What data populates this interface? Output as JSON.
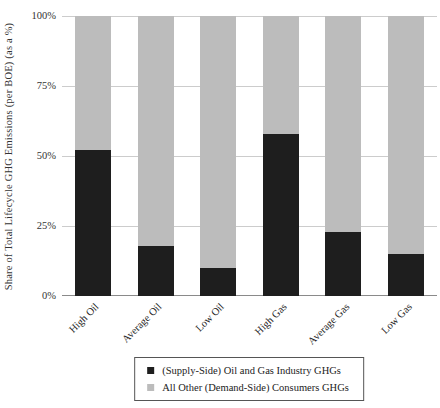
{
  "chart_data": {
    "type": "bar",
    "stacked": true,
    "categories": [
      "High Oil",
      "Average Oil",
      "Low Oil",
      "High Gas",
      "Average Gas",
      "Low Gas"
    ],
    "series": [
      {
        "name": "(Supply-Side) Oil and Gas Industry GHGs",
        "color": "#1e1e1e",
        "values": [
          52,
          18,
          10,
          58,
          23,
          15
        ]
      },
      {
        "name": "All Other (Demand-Side) Consumers GHGs",
        "color": "#bcbcbc",
        "values": [
          48,
          82,
          90,
          42,
          77,
          85
        ]
      }
    ],
    "title": "",
    "xlabel": "",
    "ylabel": "Share of Total Lifecycle GHG Emissions (per BOE) (as a %)",
    "ylim": [
      0,
      100
    ],
    "yticks": [
      0,
      25,
      50,
      75,
      100
    ],
    "ytick_labels": [
      "0%",
      "25%",
      "50%",
      "75%",
      "100%"
    ],
    "grid": true,
    "legend_position": "bottom-boxed"
  },
  "colors": {
    "background": "#ffffff",
    "gridline": "#cccccc",
    "axis_line": "#8a8a8a",
    "text": "#222222",
    "legend_border": "#555555"
  }
}
